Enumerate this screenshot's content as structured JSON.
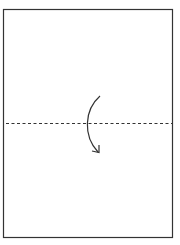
{
  "diagram": {
    "type": "folding-instruction",
    "paper": {
      "x": 3,
      "y": 9,
      "width": 170,
      "height": 229,
      "stroke": "#333333",
      "fill": "#ffffff"
    },
    "fold_line": {
      "style": "dashed",
      "y": 123,
      "x1": 6,
      "x2": 173,
      "stroke": "#333333",
      "label": "valley fold"
    },
    "arrow": {
      "direction": "down",
      "meaning": "fold top half down",
      "stroke": "#333333"
    }
  }
}
